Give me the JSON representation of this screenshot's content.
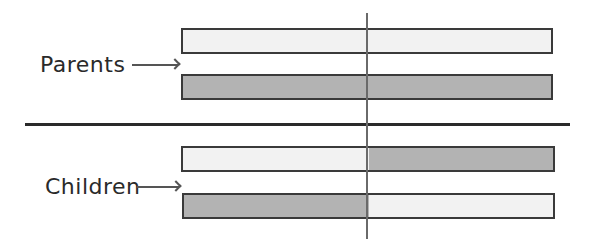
{
  "labels": {
    "parents": "Parents",
    "children": "Children"
  },
  "colors": {
    "light_fill": "#f2f2f2",
    "dark_fill": "#b3b3b3",
    "outline": "#3a3a3a",
    "divider": "#2a2a2a",
    "center_line": "#6a6a6a"
  },
  "groups": [
    {
      "name": "Parents",
      "bars": [
        {
          "left_segment": "light",
          "right_segment": "light"
        },
        {
          "left_segment": "dark",
          "right_segment": "dark"
        }
      ]
    },
    {
      "name": "Children",
      "bars": [
        {
          "left_segment": "light",
          "right_segment": "dark"
        },
        {
          "left_segment": "dark",
          "right_segment": "light"
        }
      ]
    }
  ]
}
